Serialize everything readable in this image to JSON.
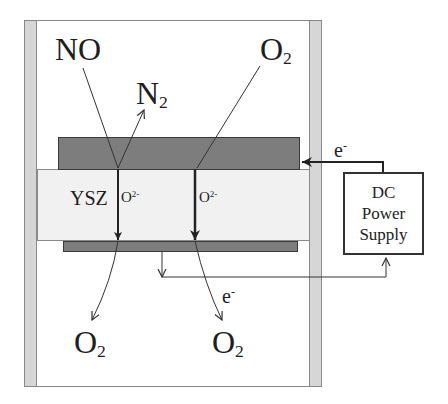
{
  "diagram": {
    "type": "electrochemical-cell-schematic",
    "colors": {
      "background": "#ffffff",
      "frame_bar": "#d6d6d6",
      "electrode": "#7d7d7d",
      "electrolyte": "#f1f1f1",
      "lines": "#333333"
    },
    "labels": {
      "no_in": "NO",
      "n2_out": {
        "base": "N",
        "sub": "2"
      },
      "o2_in": {
        "base": "O",
        "sub": "2"
      },
      "electrolyte": "YSZ",
      "oxide_ion_left": {
        "base": "O",
        "sup": "2-"
      },
      "oxide_ion_right": {
        "base": "O",
        "sup": "2-"
      },
      "electron_top": {
        "base": "e",
        "sup": "-"
      },
      "electron_bottom": {
        "base": "e",
        "sup": "-"
      },
      "o2_out_left": {
        "base": "O",
        "sub": "2"
      },
      "o2_out_right": {
        "base": "O",
        "sub": "2"
      }
    },
    "power_supply": {
      "lines": [
        "DC",
        "Power",
        "Supply"
      ]
    },
    "components": [
      "outer-chamber",
      "cathode-top-electrode",
      "ysz-electrolyte",
      "anode-bottom-electrode",
      "dc-power-supply",
      "external-circuit-wire"
    ]
  }
}
